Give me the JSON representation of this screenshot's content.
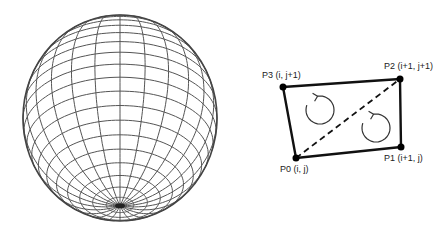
{
  "sphere": {
    "label": "wireframe-sphere",
    "cx": 120,
    "cy": 118,
    "rx": 97,
    "ry": 103,
    "meridians": 24,
    "parallels": 22,
    "line_color": "#555555"
  },
  "quad": {
    "points": [
      {
        "id": "P0",
        "label": "P0 (i, j)",
        "x": 296,
        "y": 158
      },
      {
        "id": "P1",
        "label": "P1 (i+1, j)",
        "x": 401,
        "y": 147
      },
      {
        "id": "P2",
        "label": "P2 (i+1, j+1)",
        "x": 400,
        "y": 79
      },
      {
        "id": "P3",
        "label": "P3 (i, j+1)",
        "x": 283,
        "y": 87
      }
    ],
    "diagonal": "P0-P2 dashed",
    "rotation_arrows": [
      {
        "cx": 320,
        "cy": 110,
        "r": 14,
        "direction": "counter-clockwise"
      },
      {
        "cx": 376,
        "cy": 128,
        "r": 14,
        "direction": "counter-clockwise"
      }
    ],
    "edge_color": "#111111"
  }
}
